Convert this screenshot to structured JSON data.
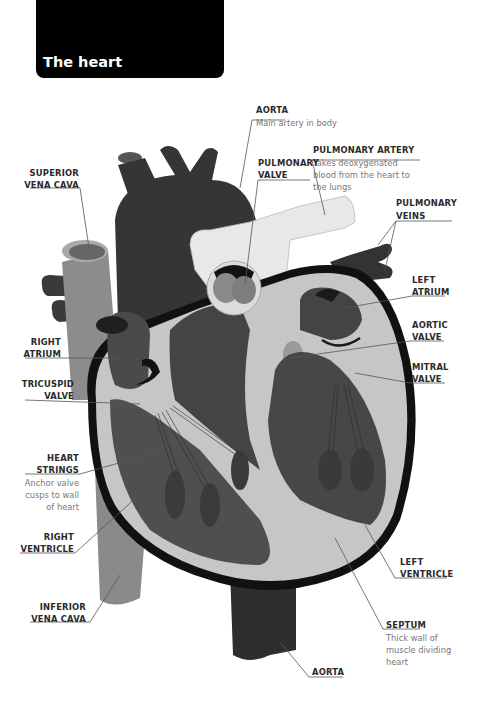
{
  "title": "The heart",
  "colors": {
    "dark": "#3a3a3a",
    "darker": "#2b2b2b",
    "medium": "#5c5c5c",
    "mid_gray": "#888888",
    "light": "#c4c4c4",
    "pale": "#e6e6e6",
    "outline": "#111111",
    "leader": "#555555"
  },
  "labels": {
    "aorta_top": {
      "name": "AORTA",
      "desc": "Main artery in body"
    },
    "pulmonary_artery": {
      "name": "PULMONARY ARTERY",
      "desc": [
        "Takes deoxygenated",
        "blood from the heart to",
        "the lungs"
      ]
    },
    "pulmonary_valve": {
      "name": [
        "PULMONARY",
        "VALVE"
      ]
    },
    "superior_vena_cava": {
      "name": [
        "SUPERIOR",
        "VENA CAVA"
      ]
    },
    "pulmonary_veins": {
      "name": [
        "PULMONARY",
        "VEINS"
      ]
    },
    "left_atrium": {
      "name": [
        "LEFT",
        "ATRIUM"
      ]
    },
    "right_atrium": {
      "name": [
        "RIGHT",
        "ATRIUM"
      ]
    },
    "aortic_valve": {
      "name": [
        "AORTIC",
        "VALVE"
      ]
    },
    "tricuspid_valve": {
      "name": [
        "TRICUSPID",
        "VALVE"
      ]
    },
    "mitral_valve": {
      "name": [
        "MITRAL",
        "VALVE"
      ]
    },
    "heart_strings": {
      "name": [
        "HEART",
        "STRINGS"
      ],
      "desc": [
        "Anchor valve",
        "cusps to wall",
        "of heart"
      ]
    },
    "right_ventricle": {
      "name": [
        "RIGHT",
        "VENTRICLE"
      ]
    },
    "left_ventricle": {
      "name": [
        "LEFT",
        "VENTRICLE"
      ]
    },
    "inferior_vena_cava": {
      "name": [
        "INFERIOR",
        "VENA CAVA"
      ]
    },
    "septum": {
      "name": "SEPTUM",
      "desc": [
        "Thick wall of",
        "muscle dividing",
        "heart"
      ]
    },
    "aorta_bottom": {
      "name": "AORTA"
    }
  }
}
